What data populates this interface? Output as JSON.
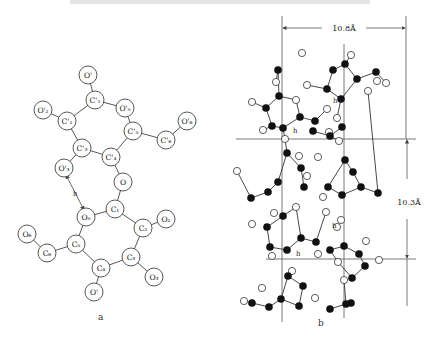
{
  "figure": {
    "caption_cut": true,
    "panel_a": {
      "label": "a",
      "label_pos": [
        98,
        320
      ],
      "atoms": [
        {
          "id": "Op_top",
          "text": "O'",
          "x": 88,
          "y": 75
        },
        {
          "id": "C1p",
          "text": "C'₁",
          "x": 95,
          "y": 100
        },
        {
          "id": "O5p",
          "text": "O'₅",
          "x": 125,
          "y": 108
        },
        {
          "id": "C2p",
          "text": "C'₂",
          "x": 67,
          "y": 121
        },
        {
          "id": "O2p",
          "text": "O'₂",
          "x": 43,
          "y": 110
        },
        {
          "id": "C5p",
          "text": "C'₅",
          "x": 133,
          "y": 131
        },
        {
          "id": "C6p",
          "text": "C'₆",
          "x": 166,
          "y": 140
        },
        {
          "id": "O6p",
          "text": "O'₆",
          "x": 187,
          "y": 121
        },
        {
          "id": "C3p",
          "text": "C'₃",
          "x": 82,
          "y": 148
        },
        {
          "id": "C4p",
          "text": "C'₄",
          "x": 111,
          "y": 157
        },
        {
          "id": "O3p",
          "text": "O'₃",
          "x": 64,
          "y": 168
        },
        {
          "id": "O_link",
          "text": "O",
          "x": 123,
          "y": 182
        },
        {
          "id": "C1",
          "text": "C₁",
          "x": 115,
          "y": 209
        },
        {
          "id": "O5",
          "text": "O₅",
          "x": 86,
          "y": 217
        },
        {
          "id": "C2",
          "text": "C₂",
          "x": 143,
          "y": 228
        },
        {
          "id": "O2",
          "text": "O₂",
          "x": 166,
          "y": 219
        },
        {
          "id": "C5",
          "text": "C₅",
          "x": 76,
          "y": 244
        },
        {
          "id": "C6",
          "text": "C₆",
          "x": 47,
          "y": 253
        },
        {
          "id": "O6",
          "text": "O₆",
          "x": 27,
          "y": 234
        },
        {
          "id": "C3",
          "text": "C₃",
          "x": 131,
          "y": 257
        },
        {
          "id": "C4",
          "text": "C₄",
          "x": 101,
          "y": 268
        },
        {
          "id": "O3",
          "text": "O₃",
          "x": 154,
          "y": 277
        },
        {
          "id": "O_bottom",
          "text": "O'",
          "x": 94,
          "y": 292
        }
      ],
      "bonds": [
        [
          "Op_top",
          "C1p"
        ],
        [
          "C1p",
          "O5p"
        ],
        [
          "C1p",
          "C2p"
        ],
        [
          "C2p",
          "O2p"
        ],
        [
          "O5p",
          "C5p"
        ],
        [
          "C5p",
          "C6p"
        ],
        [
          "C6p",
          "O6p"
        ],
        [
          "C2p",
          "C3p"
        ],
        [
          "C3p",
          "C4p"
        ],
        [
          "C4p",
          "C5p"
        ],
        [
          "C3p",
          "O3p"
        ],
        [
          "C4p",
          "O_link"
        ],
        [
          "O_link",
          "C1"
        ],
        [
          "C1",
          "O5"
        ],
        [
          "C1",
          "C2"
        ],
        [
          "C2",
          "O2"
        ],
        [
          "O5",
          "C5"
        ],
        [
          "C5",
          "C6"
        ],
        [
          "C6",
          "O6"
        ],
        [
          "C2",
          "C3"
        ],
        [
          "C3",
          "C4"
        ],
        [
          "C4",
          "C5"
        ],
        [
          "C3",
          "O3"
        ],
        [
          "C4",
          "O_bottom"
        ]
      ],
      "hbond": {
        "from": [
          66,
          175
        ],
        "to": [
          84,
          210
        ],
        "label": "h"
      }
    },
    "panel_b": {
      "label": "b",
      "label_pos": [
        318,
        326
      ],
      "dimension_width": {
        "text": "10.8Å",
        "x1": 282,
        "x2": 406,
        "y": 28
      },
      "dimension_height": {
        "text": "10.3Å",
        "x": 407,
        "y1": 139,
        "y2": 259
      },
      "vlines": [
        {
          "x": 282,
          "y1": 16,
          "y2": 322
        },
        {
          "x": 344,
          "y1": 44,
          "y2": 318
        },
        {
          "x": 406,
          "y1": 16,
          "y2": 139
        }
      ],
      "hlines": [
        {
          "y": 139,
          "x1": 236,
          "x2": 416
        },
        {
          "y": 259,
          "x1": 266,
          "x2": 416
        }
      ],
      "h_labels": [
        {
          "text": "h",
          "x": 333,
          "y": 103
        },
        {
          "text": "h",
          "x": 293,
          "y": 133
        },
        {
          "text": "h",
          "x": 332,
          "y": 228
        },
        {
          "text": "h",
          "x": 296,
          "y": 256
        }
      ],
      "filled_atoms": [
        [
          278,
          70
        ],
        [
          279,
          96
        ],
        [
          266,
          108
        ],
        [
          272,
          126
        ],
        [
          283,
          128
        ],
        [
          300,
          117
        ],
        [
          315,
          121
        ],
        [
          313,
          131
        ],
        [
          330,
          136
        ],
        [
          342,
          127
        ],
        [
          345,
          64
        ],
        [
          333,
          70
        ],
        [
          327,
          89
        ],
        [
          341,
          99
        ],
        [
          357,
          79
        ],
        [
          376,
          72
        ],
        [
          287,
          153
        ],
        [
          301,
          168
        ],
        [
          278,
          182
        ],
        [
          268,
          192
        ],
        [
          251,
          198
        ],
        [
          304,
          187
        ],
        [
          345,
          160
        ],
        [
          353,
          172
        ],
        [
          328,
          187
        ],
        [
          342,
          195
        ],
        [
          361,
          187
        ],
        [
          378,
          193
        ],
        [
          283,
          216
        ],
        [
          267,
          227
        ],
        [
          270,
          247
        ],
        [
          287,
          250
        ],
        [
          301,
          238
        ],
        [
          316,
          242
        ],
        [
          330,
          250
        ],
        [
          344,
          246
        ],
        [
          359,
          254
        ],
        [
          365,
          266
        ],
        [
          352,
          278
        ],
        [
          288,
          276
        ],
        [
          303,
          286
        ],
        [
          281,
          299
        ],
        [
          269,
          307
        ],
        [
          252,
          303
        ],
        [
          299,
          306
        ],
        [
          330,
          309
        ],
        [
          346,
          304
        ],
        [
          351,
          303
        ]
      ],
      "open_atoms": [
        [
          276,
          82
        ],
        [
          296,
          100
        ],
        [
          252,
          102
        ],
        [
          263,
          130
        ],
        [
          307,
          85
        ],
        [
          327,
          109
        ],
        [
          337,
          118
        ],
        [
          339,
          141
        ],
        [
          318,
          157
        ],
        [
          377,
          81
        ],
        [
          302,
          53
        ],
        [
          351,
          55
        ],
        [
          386,
          83
        ],
        [
          368,
          91
        ],
        [
          329,
          132
        ],
        [
          285,
          139
        ],
        [
          299,
          156
        ],
        [
          237,
          171
        ],
        [
          307,
          176
        ],
        [
          323,
          197
        ],
        [
          318,
          254
        ],
        [
          274,
          213
        ],
        [
          296,
          207
        ],
        [
          252,
          224
        ],
        [
          272,
          256
        ],
        [
          326,
          212
        ],
        [
          341,
          220
        ],
        [
          337,
          227
        ],
        [
          366,
          241
        ],
        [
          379,
          260
        ],
        [
          338,
          262
        ],
        [
          344,
          280
        ],
        [
          292,
          271
        ],
        [
          262,
          288
        ],
        [
          315,
          298
        ],
        [
          244,
          301
        ]
      ],
      "bonds_b": [
        [
          [
            278,
            70
          ],
          [
            276,
            82
          ]
        ],
        [
          [
            278,
            70
          ],
          [
            279,
            96
          ]
        ],
        [
          [
            279,
            96
          ],
          [
            266,
            108
          ]
        ],
        [
          [
            266,
            108
          ],
          [
            272,
            126
          ]
        ],
        [
          [
            272,
            126
          ],
          [
            283,
            128
          ]
        ],
        [
          [
            283,
            128
          ],
          [
            300,
            117
          ]
        ],
        [
          [
            300,
            117
          ],
          [
            296,
            100
          ]
        ],
        [
          [
            296,
            100
          ],
          [
            279,
            96
          ]
        ],
        [
          [
            266,
            108
          ],
          [
            252,
            102
          ]
        ],
        [
          [
            272,
            126
          ],
          [
            263,
            130
          ]
        ],
        [
          [
            300,
            117
          ],
          [
            315,
            121
          ]
        ],
        [
          [
            315,
            121
          ],
          [
            327,
            109
          ]
        ],
        [
          [
            283,
            128
          ],
          [
            285,
            139
          ]
        ],
        [
          [
            313,
            131
          ],
          [
            330,
            136
          ]
        ],
        [
          [
            330,
            136
          ],
          [
            342,
            127
          ]
        ],
        [
          [
            345,
            64
          ],
          [
            333,
            70
          ]
        ],
        [
          [
            333,
            70
          ],
          [
            327,
            89
          ]
        ],
        [
          [
            327,
            89
          ],
          [
            341,
            99
          ]
        ],
        [
          [
            341,
            99
          ],
          [
            357,
            79
          ]
        ],
        [
          [
            357,
            79
          ],
          [
            345,
            64
          ]
        ],
        [
          [
            357,
            79
          ],
          [
            376,
            72
          ]
        ],
        [
          [
            376,
            72
          ],
          [
            386,
            83
          ]
        ],
        [
          [
            341,
            99
          ],
          [
            337,
            118
          ]
        ],
        [
          [
            327,
            89
          ],
          [
            307,
            85
          ]
        ],
        [
          [
            345,
            64
          ],
          [
            351,
            55
          ]
        ],
        [
          [
            330,
            136
          ],
          [
            339,
            141
          ]
        ],
        [
          [
            287,
            153
          ],
          [
            301,
            168
          ]
        ],
        [
          [
            301,
            168
          ],
          [
            304,
            187
          ]
        ],
        [
          [
            287,
            153
          ],
          [
            278,
            182
          ]
        ],
        [
          [
            278,
            182
          ],
          [
            268,
            192
          ]
        ],
        [
          [
            268,
            192
          ],
          [
            251,
            198
          ]
        ],
        [
          [
            251,
            198
          ],
          [
            237,
            171
          ]
        ],
        [
          [
            285,
            139
          ],
          [
            287,
            153
          ]
        ],
        [
          [
            345,
            160
          ],
          [
            353,
            172
          ]
        ],
        [
          [
            353,
            172
          ],
          [
            361,
            187
          ]
        ],
        [
          [
            361,
            187
          ],
          [
            378,
            193
          ]
        ],
        [
          [
            378,
            193
          ],
          [
            368,
            91
          ]
        ],
        [
          [
            345,
            160
          ],
          [
            328,
            187
          ]
        ],
        [
          [
            328,
            187
          ],
          [
            342,
            195
          ]
        ],
        [
          [
            342,
            195
          ],
          [
            361,
            187
          ]
        ],
        [
          [
            283,
            216
          ],
          [
            267,
            227
          ]
        ],
        [
          [
            267,
            227
          ],
          [
            270,
            247
          ]
        ],
        [
          [
            270,
            247
          ],
          [
            287,
            250
          ]
        ],
        [
          [
            287,
            250
          ],
          [
            301,
            238
          ]
        ],
        [
          [
            301,
            238
          ],
          [
            296,
            207
          ]
        ],
        [
          [
            296,
            207
          ],
          [
            283,
            216
          ]
        ],
        [
          [
            301,
            238
          ],
          [
            316,
            242
          ]
        ],
        [
          [
            316,
            242
          ],
          [
            326,
            212
          ]
        ],
        [
          [
            330,
            250
          ],
          [
            344,
            246
          ]
        ],
        [
          [
            344,
            246
          ],
          [
            359,
            254
          ]
        ],
        [
          [
            359,
            254
          ],
          [
            365,
            266
          ]
        ],
        [
          [
            365,
            266
          ],
          [
            352,
            278
          ]
        ],
        [
          [
            352,
            278
          ],
          [
            338,
            262
          ]
        ],
        [
          [
            338,
            262
          ],
          [
            330,
            250
          ]
        ],
        [
          [
            288,
            276
          ],
          [
            303,
            286
          ]
        ],
        [
          [
            303,
            286
          ],
          [
            299,
            306
          ]
        ],
        [
          [
            299,
            306
          ],
          [
            281,
            299
          ]
        ],
        [
          [
            281,
            299
          ],
          [
            288,
            276
          ]
        ],
        [
          [
            281,
            299
          ],
          [
            269,
            307
          ]
        ],
        [
          [
            269,
            307
          ],
          [
            252,
            303
          ]
        ],
        [
          [
            252,
            303
          ],
          [
            244,
            301
          ]
        ],
        [
          [
            330,
            309
          ],
          [
            346,
            304
          ]
        ],
        [
          [
            346,
            304
          ],
          [
            344,
            280
          ]
        ]
      ]
    }
  }
}
